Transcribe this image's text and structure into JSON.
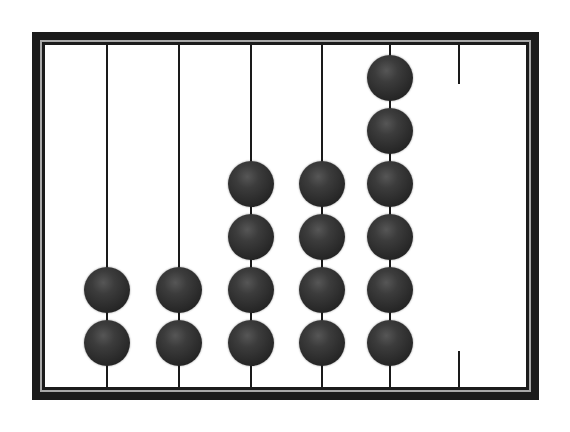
{
  "figure": {
    "type": "abacus",
    "canvas": {
      "width": 570,
      "height": 432,
      "background": "#ffffff"
    },
    "frame": {
      "left": 32,
      "top": 32,
      "width": 507,
      "height": 368,
      "color": "#1b1b1b",
      "groove_color": "#a8a8a8",
      "inner_top": 45,
      "inner_bottom": 387
    },
    "rod": {
      "width": 2,
      "color": "#1a1a1a"
    },
    "bead": {
      "diameter": 46,
      "color": "#2d2d2d"
    },
    "bead_rows_y": [
      78,
      131,
      184,
      237,
      290,
      343
    ],
    "rods": [
      {
        "x": 107,
        "beads": 2
      },
      {
        "x": 179,
        "beads": 2
      },
      {
        "x": 251,
        "beads": 4
      },
      {
        "x": 322,
        "beads": 4
      },
      {
        "x": 390,
        "beads": 6
      }
    ],
    "partial_rod": {
      "x": 459,
      "stubs": [
        {
          "top": 45,
          "height": 39
        },
        {
          "top": 351,
          "height": 36
        }
      ]
    },
    "bead_counts_left_to_right": [
      2,
      2,
      4,
      4,
      6
    ]
  }
}
